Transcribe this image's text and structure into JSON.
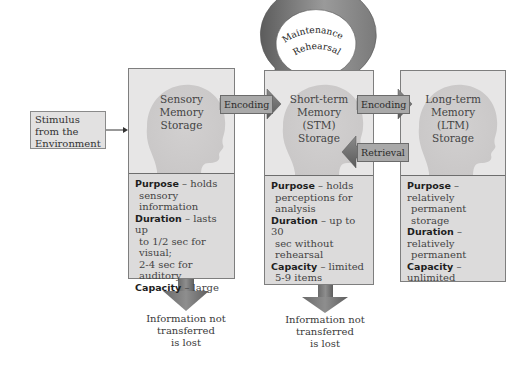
{
  "stimulus": {
    "label": "Stimulus from the Environment",
    "lines": [
      "Stimulus",
      "from the",
      "Environment"
    ]
  },
  "stores": [
    {
      "id": "sensory",
      "title_lines": [
        "Sensory",
        "Memory",
        "Storage"
      ],
      "purpose_label": "Purpose",
      "purpose_text": "– holds",
      "purpose_cont": [
        "sensory information"
      ],
      "duration_label": "Duration",
      "duration_text": " – lasts up",
      "duration_cont": [
        "to 1/2 sec for visual;",
        "2-4 sec for auditory"
      ],
      "capacity_label": "Capacity",
      "capacity_text": "– large",
      "capacity_cont": []
    },
    {
      "id": "stm",
      "title_lines": [
        "Short-term",
        "Memory",
        "(STM)",
        "Storage"
      ],
      "purpose_label": "Purpose",
      "purpose_text": "– holds",
      "purpose_cont": [
        "perceptions for",
        "analysis"
      ],
      "duration_label": "Duration",
      "duration_text": " – up to 30",
      "duration_cont": [
        "sec without rehearsal"
      ],
      "capacity_label": "Capacity",
      "capacity_text": "– limited",
      "capacity_cont": [
        "5-9 items"
      ]
    },
    {
      "id": "ltm",
      "title_lines": [
        "Long-term",
        "Memory",
        "(LTM)",
        "Storage"
      ],
      "purpose_label": "Purpose",
      "purpose_text": "– relatively",
      "purpose_cont": [
        "permanent storage"
      ],
      "duration_label": "Duration",
      "duration_text": " – relatively",
      "duration_cont": [
        "permanent"
      ],
      "capacity_label": "Capacity",
      "capacity_text": "– unlimited",
      "capacity_cont": []
    }
  ],
  "arrows": {
    "encoding1": "Encoding",
    "encoding2": "Encoding",
    "retrieval": "Retrieval",
    "rehearsal_line1": "Maintenance",
    "rehearsal_line2": "Rehearsal"
  },
  "lost": [
    {
      "lines": [
        "Information not",
        "transferred",
        "is lost"
      ]
    },
    {
      "lines": [
        "Information not",
        "transferred",
        "is lost"
      ]
    }
  ],
  "colors": {
    "box_fill": "#e7e6e6",
    "info_fill": "#dcdbdb",
    "arrow_dark": "#5f5f5f",
    "arrow_light": "#a3a3a3",
    "head_silhouette": "#cfcdcd"
  }
}
